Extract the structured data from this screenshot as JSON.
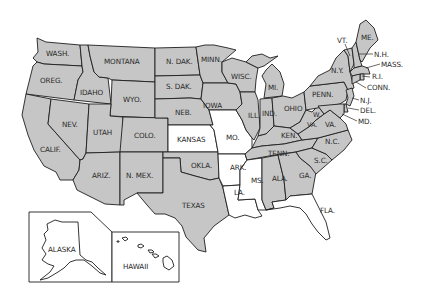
{
  "map": {
    "title": "United States",
    "colors": {
      "shaded": "#c6c6c6",
      "unshaded": "#ffffff",
      "border": "#1e1e1e",
      "label": "#2a2a2a"
    },
    "unshaded_states": [
      "KANSAS",
      "MO.",
      "ARK.",
      "LA.",
      "MS.",
      "FLA."
    ],
    "labels": {
      "wash": "WASH.",
      "oreg": "OREG.",
      "calif": "CALIF.",
      "idaho": "IDAHO",
      "nev": "NEV.",
      "montana": "MONTANA",
      "wyo": "WYO.",
      "utah": "UTAH",
      "ariz": "ARIZ.",
      "colo": "COLO.",
      "nmex": "N. MEX.",
      "ndak": "N. DAK.",
      "sdak": "S. DAK.",
      "neb": "NEB.",
      "kansas": "KANSAS",
      "okla": "OKLA.",
      "texas": "TEXAS",
      "minn": "MINN.",
      "iowa": "IOWA",
      "mo": "MO.",
      "ark": "ARK.",
      "la": "LA.",
      "wisc": "WISC.",
      "ill": "ILL.",
      "mi": "MI.",
      "ind": "IND.",
      "ohio": "OHIO",
      "ken": "KEN.",
      "tenn": "TENN.",
      "ms": "MS.",
      "ala": "ALA.",
      "ga": "GA.",
      "fla": "FLA.",
      "sc": "S.C.",
      "nc": "N.C.",
      "va": "VA.",
      "wva_w": "W.",
      "wva_va": "VA.",
      "penn": "PENN.",
      "ny": "N.Y.",
      "vt": "VT.",
      "nh": "N.H.",
      "me": "ME.",
      "mass": "MASS.",
      "ri": "R.I.",
      "conn": "CONN.",
      "nj": "N.J.",
      "del": "DEL.",
      "md": "MD.",
      "alaska": "ALASKA",
      "hawaii": "HAWAII"
    }
  }
}
